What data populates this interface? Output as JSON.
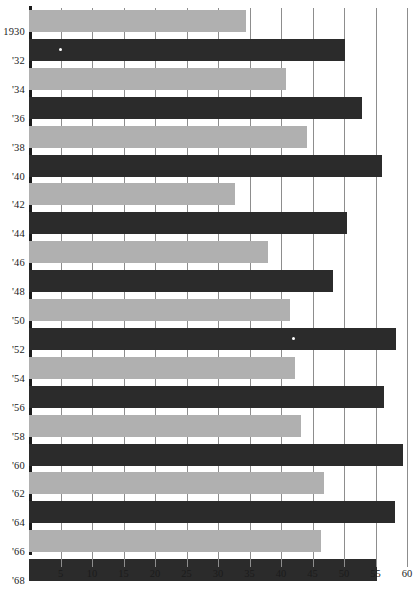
{
  "chart_data": {
    "type": "bar",
    "orientation": "horizontal",
    "title": "",
    "subtitle": "",
    "xlabel": "",
    "ylabel": "",
    "xlim": [
      0,
      60
    ],
    "ylim": null,
    "grid": "vertical",
    "legend": "none",
    "xticks": [
      5,
      10,
      15,
      20,
      25,
      30,
      35,
      40,
      45,
      50,
      55,
      60
    ],
    "xtick_labels": [
      "5",
      "10",
      "15",
      "20",
      "25",
      "30",
      "35",
      "40",
      "45",
      "50",
      "55",
      "60"
    ],
    "categories": [
      "1930",
      "'32",
      "'34",
      "'36",
      "'38",
      "'40",
      "'42",
      "'44",
      "'46",
      "'48",
      "'50",
      "'52",
      "'54",
      "'56",
      "'58",
      "'60",
      "'62",
      "'64",
      "'66",
      "'68"
    ],
    "values": [
      34.5,
      50.2,
      40.8,
      52.9,
      44.2,
      56.1,
      32.7,
      50.5,
      37.9,
      48.2,
      41.5,
      58.2,
      42.3,
      56.3,
      43.1,
      59.4,
      46.8,
      58.1,
      46.3,
      55.2
    ],
    "bar_colors": [
      "#b0b0b0",
      "#2b2b2b",
      "#b0b0b0",
      "#2b2b2b",
      "#b0b0b0",
      "#2b2b2b",
      "#b0b0b0",
      "#2b2b2b",
      "#b0b0b0",
      "#2b2b2b",
      "#b0b0b0",
      "#2b2b2b",
      "#b0b0b0",
      "#2b2b2b",
      "#b0b0b0",
      "#2b2b2b",
      "#b0b0b0",
      "#2b2b2b",
      "#b0b0b0",
      "#2b2b2b"
    ],
    "colors": {
      "light_bar": "#b0b0b0",
      "dark_bar": "#2b2b2b",
      "gridline": "#8d8d8d",
      "axis": "#1b1b1b",
      "background": "#ffffff",
      "text": "#1b1b1b"
    },
    "annotations": [
      {
        "label": "speck",
        "series_index": 1,
        "x_value": 4.8
      },
      {
        "label": "speck",
        "series_index": 11,
        "x_value": 41.8
      }
    ]
  }
}
